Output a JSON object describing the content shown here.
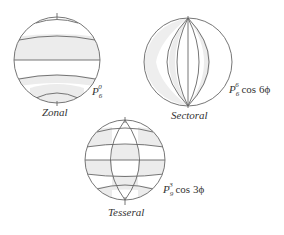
{
  "diagram": {
    "spheres": [
      {
        "id": "zonal",
        "name": "Zonal",
        "function": {
          "base": "P",
          "sub": "6",
          "sup": "0",
          "suffix": ""
        }
      },
      {
        "id": "sectoral",
        "name": "Sectoral",
        "function": {
          "base": "P",
          "sub": "6",
          "sup": "6",
          "suffix": " cos 6ϕ"
        }
      },
      {
        "id": "tesseral",
        "name": "Tesseral",
        "function": {
          "base": "P",
          "sub": "9",
          "sup": "3",
          "suffix": " cos 3ϕ"
        }
      }
    ],
    "colors": {
      "line": "#666666",
      "shade": "#ececec",
      "text": "#333333",
      "background": "#ffffff"
    }
  }
}
